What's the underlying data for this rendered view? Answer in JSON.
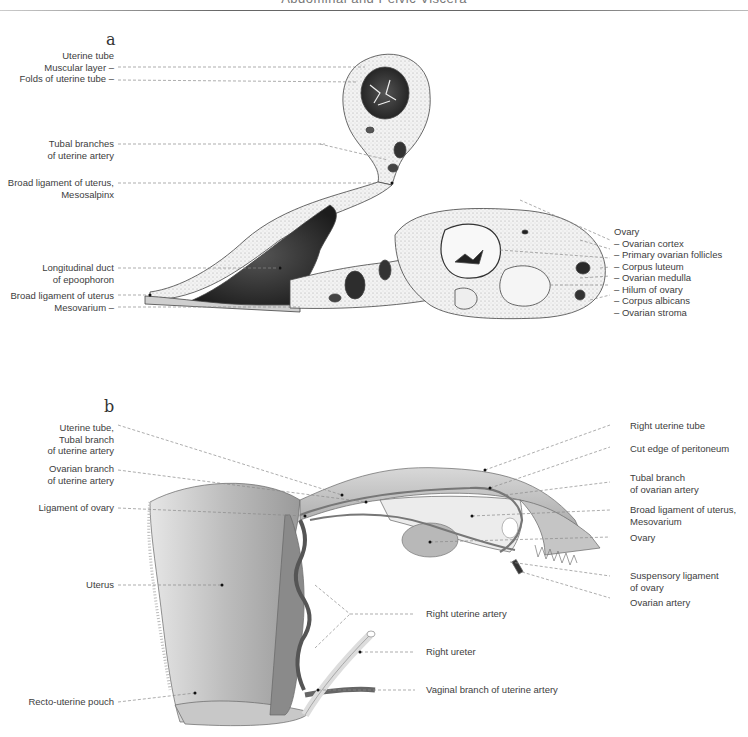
{
  "header": {
    "title": "Abdominal and Pelvic Viscera"
  },
  "panel_a": {
    "letter": "a",
    "left_labels": [
      {
        "id": "uterine-tube",
        "lines": [
          "Uterine tube",
          "Muscular layer –",
          "Folds of uterine tube –"
        ]
      },
      {
        "id": "tubal-branches",
        "lines": [
          "Tubal branches",
          "of uterine artery"
        ]
      },
      {
        "id": "mesosalpinx",
        "lines": [
          "Broad ligament of uterus,",
          "Mesosalpinx"
        ]
      },
      {
        "id": "epoophoron",
        "lines": [
          "Longitudinal duct",
          "of epoophoron"
        ]
      },
      {
        "id": "mesovarium",
        "lines": [
          "Broad ligament of uterus",
          "Mesovarium –"
        ]
      }
    ],
    "right_labels": {
      "heading": "Ovary",
      "items": [
        "– Ovarian cortex",
        "– Primary ovarian follicles",
        "– Corpus luteum",
        "– Ovarian medulla",
        "– Hilum of ovary",
        "– Corpus albicans",
        "– Ovarian stroma"
      ]
    }
  },
  "panel_b": {
    "letter": "b",
    "left_labels": [
      {
        "id": "uterine-tube-tubal-branch",
        "lines": [
          "Uterine tube,",
          "Tubal branch",
          "of uterine artery"
        ]
      },
      {
        "id": "ovarian-branch",
        "lines": [
          "Ovarian branch",
          "of uterine artery"
        ]
      },
      {
        "id": "ligament-of-ovary",
        "lines": [
          "Ligament of ovary"
        ]
      },
      {
        "id": "uterus",
        "lines": [
          "Uterus"
        ]
      },
      {
        "id": "recto-uterine-pouch",
        "lines": [
          "Recto-uterine pouch"
        ]
      }
    ],
    "right_labels": [
      {
        "id": "right-uterine-tube",
        "lines": [
          "Right uterine tube"
        ]
      },
      {
        "id": "cut-edge-peritoneum",
        "lines": [
          "Cut edge of peritoneum"
        ]
      },
      {
        "id": "tubal-branch-ovarian",
        "lines": [
          "Tubal branch",
          "of ovarian artery"
        ]
      },
      {
        "id": "broad-ligament-mesovarium",
        "lines": [
          "Broad ligament of uterus,",
          "Mesovarium"
        ]
      },
      {
        "id": "ovary",
        "lines": [
          "Ovary"
        ]
      },
      {
        "id": "suspensory-ligament",
        "lines": [
          "Suspensory ligament",
          "of ovary"
        ]
      },
      {
        "id": "ovarian-artery",
        "lines": [
          "Ovarian artery"
        ]
      }
    ],
    "center_labels": [
      {
        "id": "right-uterine-artery",
        "lines": [
          "Right uterine artery"
        ]
      },
      {
        "id": "right-ureter",
        "lines": [
          "Right ureter"
        ]
      },
      {
        "id": "vaginal-branch",
        "lines": [
          "Vaginal branch of uterine artery"
        ]
      }
    ]
  },
  "colors": {
    "line": "#8a8a8a",
    "text": "#3d3d3d",
    "tissue_dark": "#2a2a2a",
    "tissue_mid": "#9a9a9a",
    "tissue_light": "#d8d8d8"
  }
}
